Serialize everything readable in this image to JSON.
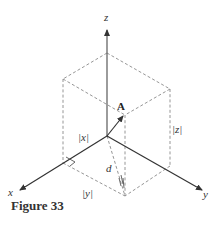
{
  "figure": {
    "caption": "Figure 33",
    "labels": {
      "x_axis": "x",
      "y_axis": "y",
      "z_axis": "z",
      "point": "A",
      "abs_x": "|x|",
      "abs_y": "|y|",
      "abs_z": "|z|",
      "distance": "d"
    },
    "colors": {
      "axis": "#333333",
      "dashed": "#8a8a8a"
    }
  }
}
